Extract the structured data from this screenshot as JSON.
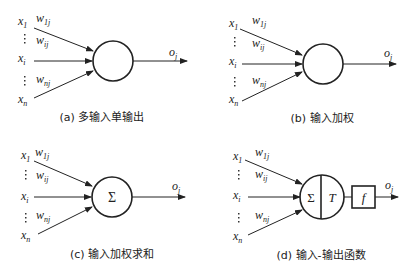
{
  "panels": [
    {
      "id": "a",
      "caption": "(a) 多输入单输出",
      "inputs": [
        "x",
        "x",
        "x"
      ],
      "input_subs": [
        "1",
        "i",
        "n"
      ],
      "weights": [
        "w",
        "w",
        "w"
      ],
      "weight_subs": [
        "1j",
        "ij",
        "nj"
      ],
      "output": "o",
      "output_sub": "j",
      "neuron_symbol": ""
    },
    {
      "id": "b",
      "caption": "(b) 输入加权",
      "inputs": [
        "x",
        "x",
        "x"
      ],
      "input_subs": [
        "1",
        "i",
        "n"
      ],
      "weights": [
        "w",
        "w",
        "w"
      ],
      "weight_subs": [
        "1j",
        "ij",
        "nj"
      ],
      "output": "o",
      "output_sub": "j",
      "neuron_symbol": ""
    },
    {
      "id": "c",
      "caption": "(c) 输入加权求和",
      "inputs": [
        "x",
        "x",
        "x"
      ],
      "input_subs": [
        "1",
        "i",
        "n"
      ],
      "weights": [
        "w",
        "w",
        "w"
      ],
      "weight_subs": [
        "1j",
        "ij",
        "nj"
      ],
      "output": "o",
      "output_sub": "j",
      "neuron_symbol": "Σ"
    },
    {
      "id": "d",
      "caption": "(d) 输入-输出函数",
      "inputs": [
        "x",
        "x",
        "x"
      ],
      "input_subs": [
        "1",
        "i",
        "n"
      ],
      "weights": [
        "w",
        "w",
        "w"
      ],
      "weight_subs": [
        "1j",
        "ij",
        "nj"
      ],
      "output": "o",
      "output_sub": "j",
      "neuron_symbol": "Σ",
      "threshold_symbol": "T",
      "function_symbol": "f"
    }
  ],
  "colors": {
    "stroke": "#222222",
    "background": "#ffffff"
  }
}
